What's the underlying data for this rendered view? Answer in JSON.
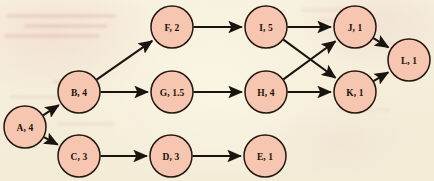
{
  "diagram": {
    "background_color": "#f7f2de",
    "node_fill_color": "#f6c6b0",
    "node_stroke_color": "#241610",
    "edge_color": "#1a1410",
    "label_color": "#1d1208",
    "node_radius": 21,
    "nodes": [
      {
        "id": "A",
        "label": "A, 4",
        "name": "A",
        "duration": "4",
        "cx": 25,
        "cy": 127
      },
      {
        "id": "B",
        "label": "B, 4",
        "name": "B",
        "duration": "4",
        "cx": 79,
        "cy": 92
      },
      {
        "id": "C",
        "label": "C, 3",
        "name": "C",
        "duration": "3",
        "cx": 79,
        "cy": 156
      },
      {
        "id": "D",
        "label": "D, 3",
        "name": "D",
        "duration": "3",
        "cx": 171,
        "cy": 156
      },
      {
        "id": "E",
        "label": "E, 1",
        "name": "E",
        "duration": "1",
        "cx": 265,
        "cy": 156
      },
      {
        "id": "F",
        "label": "F, 2",
        "name": "F",
        "duration": "2",
        "cx": 172,
        "cy": 27
      },
      {
        "id": "G",
        "label": "G, 1.5",
        "name": "G",
        "duration": "1.5",
        "cx": 172,
        "cy": 92
      },
      {
        "id": "H",
        "label": "H, 4",
        "name": "H",
        "duration": "4",
        "cx": 266,
        "cy": 92
      },
      {
        "id": "I",
        "label": "I, 5",
        "name": "I",
        "duration": "5",
        "cx": 266,
        "cy": 27
      },
      {
        "id": "J",
        "label": "J, 1",
        "name": "J",
        "duration": "1",
        "cx": 355,
        "cy": 27
      },
      {
        "id": "K",
        "label": "K, 1",
        "name": "K",
        "duration": "1",
        "cx": 355,
        "cy": 92
      },
      {
        "id": "L",
        "label": "L, 1",
        "name": "L",
        "duration": "1",
        "cx": 409,
        "cy": 60
      }
    ],
    "edges": [
      {
        "from": "A",
        "to": "B"
      },
      {
        "from": "A",
        "to": "C"
      },
      {
        "from": "B",
        "to": "F"
      },
      {
        "from": "B",
        "to": "G"
      },
      {
        "from": "C",
        "to": "D"
      },
      {
        "from": "D",
        "to": "E"
      },
      {
        "from": "F",
        "to": "I"
      },
      {
        "from": "G",
        "to": "H"
      },
      {
        "from": "I",
        "to": "J"
      },
      {
        "from": "I",
        "to": "K"
      },
      {
        "from": "H",
        "to": "J"
      },
      {
        "from": "H",
        "to": "K"
      },
      {
        "from": "J",
        "to": "L"
      },
      {
        "from": "K",
        "to": "L"
      }
    ]
  }
}
